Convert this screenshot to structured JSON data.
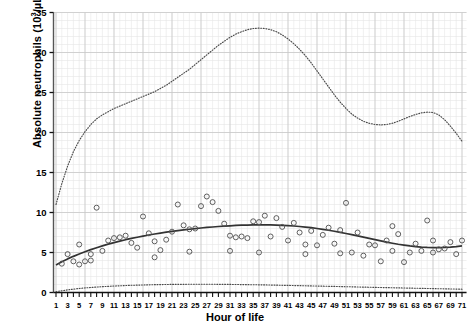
{
  "chart_data": {
    "type": "scatter",
    "title": "",
    "xlabel": "Hour of life",
    "ylabel": "Absolute neutrophils (10³/µL)",
    "ylabel_main": "Absolute neutrophils (10",
    "ylabel_sup": "3",
    "ylabel_tail": "/µL)",
    "xlim": [
      1,
      71
    ],
    "ylim": [
      0,
      35
    ],
    "yticks": [
      0,
      5,
      10,
      15,
      20,
      25,
      30,
      35
    ],
    "ytick_labels": [
      "0",
      "5",
      "10",
      "15",
      "20",
      "25",
      "30",
      "35"
    ],
    "xticks": [
      1,
      3,
      5,
      7,
      9,
      11,
      13,
      15,
      17,
      19,
      21,
      23,
      25,
      27,
      29,
      31,
      33,
      35,
      37,
      39,
      41,
      43,
      45,
      47,
      49,
      51,
      53,
      55,
      57,
      59,
      61,
      63,
      65,
      67,
      69,
      71
    ],
    "xtick_labels": [
      "1",
      "3",
      "5",
      "7",
      "9",
      "11",
      "13",
      "15",
      "17",
      "19",
      "21",
      "23",
      "25",
      "27",
      "29",
      "31",
      "33",
      "35",
      "37",
      "39",
      "41",
      "43",
      "45",
      "47",
      "49",
      "51",
      "53",
      "55",
      "57",
      "59",
      "61",
      "63",
      "65",
      "67",
      "69",
      "71"
    ],
    "x_minor_step": 1,
    "y_minor_step": 1,
    "grid": true,
    "grid_color": "#c9c9c9",
    "grid_minor_color": "#e6e6e6",
    "legend": "none",
    "series": [
      {
        "name": "Upper reference limit (97th percentile)",
        "type": "line",
        "style": "dotted",
        "color": "#4a4a4a",
        "x": [
          1,
          2,
          3,
          4,
          5,
          6,
          7,
          8,
          9,
          10,
          11,
          12,
          13,
          14,
          15,
          16,
          17,
          18,
          19,
          20,
          21,
          22,
          23,
          24,
          25,
          26,
          27,
          28,
          29,
          30,
          31,
          32,
          33,
          34,
          35,
          36,
          37,
          38,
          39,
          40,
          41,
          42,
          43,
          44,
          45,
          46,
          47,
          48,
          49,
          50,
          51,
          52,
          53,
          54,
          55,
          56,
          57,
          58,
          59,
          60,
          61,
          62,
          63,
          64,
          65,
          66,
          67,
          68,
          69,
          70,
          71
        ],
        "y": [
          11.0,
          13.6,
          15.8,
          17.6,
          19.0,
          20.1,
          21.0,
          21.7,
          22.2,
          22.6,
          23.0,
          23.3,
          23.6,
          23.9,
          24.2,
          24.5,
          24.8,
          25.1,
          25.5,
          25.9,
          26.4,
          26.9,
          27.4,
          27.9,
          28.5,
          29.1,
          29.7,
          30.3,
          30.9,
          31.4,
          31.9,
          32.3,
          32.6,
          32.85,
          33.0,
          33.05,
          33.0,
          32.85,
          32.6,
          32.2,
          31.7,
          31.1,
          30.4,
          29.6,
          28.7,
          27.7,
          26.7,
          25.7,
          24.7,
          23.8,
          23.0,
          22.3,
          21.8,
          21.4,
          21.15,
          21.0,
          20.95,
          21.0,
          21.15,
          21.4,
          21.7,
          22.0,
          22.25,
          22.45,
          22.55,
          22.5,
          22.2,
          21.6,
          20.8,
          19.9,
          18.9
        ]
      },
      {
        "name": "Mean / 50th percentile",
        "type": "line",
        "style": "solid",
        "color": "#333333",
        "x": [
          1,
          2,
          3,
          4,
          5,
          6,
          7,
          8,
          9,
          10,
          11,
          12,
          13,
          14,
          15,
          16,
          17,
          18,
          19,
          20,
          21,
          22,
          23,
          24,
          25,
          26,
          27,
          28,
          29,
          30,
          31,
          32,
          33,
          34,
          35,
          36,
          37,
          38,
          39,
          40,
          41,
          42,
          43,
          44,
          45,
          46,
          47,
          48,
          49,
          50,
          51,
          52,
          53,
          54,
          55,
          56,
          57,
          58,
          59,
          60,
          61,
          62,
          63,
          64,
          65,
          66,
          67,
          68,
          69,
          70,
          71
        ],
        "y": [
          3.45,
          3.85,
          4.2,
          4.52,
          4.82,
          5.1,
          5.36,
          5.6,
          5.83,
          6.04,
          6.24,
          6.42,
          6.6,
          6.76,
          6.91,
          7.05,
          7.19,
          7.31,
          7.43,
          7.54,
          7.64,
          7.74,
          7.83,
          7.91,
          7.99,
          8.06,
          8.13,
          8.19,
          8.25,
          8.3,
          8.34,
          8.38,
          8.41,
          8.43,
          8.45,
          8.46,
          8.46,
          8.45,
          8.43,
          8.4,
          8.36,
          8.31,
          8.25,
          8.18,
          8.1,
          8.0,
          7.9,
          7.78,
          7.66,
          7.52,
          7.38,
          7.23,
          7.08,
          6.92,
          6.76,
          6.6,
          6.45,
          6.3,
          6.16,
          6.03,
          5.92,
          5.82,
          5.74,
          5.68,
          5.64,
          5.62,
          5.62,
          5.64,
          5.68,
          5.74,
          5.82
        ]
      },
      {
        "name": "Lower reference limit (3rd percentile)",
        "type": "line",
        "style": "dotted",
        "color": "#4a4a4a",
        "x": [
          1,
          2,
          3,
          4,
          5,
          6,
          7,
          8,
          9,
          10,
          11,
          12,
          13,
          14,
          15,
          16,
          17,
          18,
          19,
          20,
          21,
          22,
          23,
          24,
          25,
          26,
          27,
          28,
          29,
          30,
          31,
          32,
          33,
          34,
          35,
          36,
          37,
          38,
          39,
          40,
          41,
          42,
          43,
          44,
          45,
          46,
          47,
          48,
          49,
          50,
          51,
          52,
          53,
          54,
          55,
          56,
          57,
          58,
          59,
          60,
          61,
          62,
          63,
          64,
          65,
          66,
          67,
          68,
          69,
          70,
          71
        ],
        "y": [
          0.1,
          0.22,
          0.33,
          0.42,
          0.5,
          0.57,
          0.63,
          0.68,
          0.73,
          0.77,
          0.81,
          0.84,
          0.87,
          0.9,
          0.92,
          0.94,
          0.96,
          0.98,
          0.99,
          1.0,
          1.01,
          1.02,
          1.02,
          1.03,
          1.03,
          1.03,
          1.03,
          1.03,
          1.02,
          1.02,
          1.01,
          1.0,
          0.99,
          0.98,
          0.97,
          0.96,
          0.95,
          0.93,
          0.92,
          0.9,
          0.89,
          0.87,
          0.86,
          0.84,
          0.82,
          0.81,
          0.79,
          0.77,
          0.76,
          0.74,
          0.72,
          0.71,
          0.69,
          0.67,
          0.66,
          0.64,
          0.62,
          0.61,
          0.59,
          0.58,
          0.56,
          0.55,
          0.53,
          0.52,
          0.5,
          0.49,
          0.47,
          0.46,
          0.44,
          0.43,
          0.41
        ]
      },
      {
        "name": "Observed absolute neutrophil counts",
        "type": "scatter",
        "marker": "open-circle",
        "color": "#555555",
        "points": [
          [
            2,
            3.6
          ],
          [
            3,
            4.8
          ],
          [
            4,
            3.9
          ],
          [
            5,
            6.0
          ],
          [
            5,
            3.5
          ],
          [
            6,
            3.9
          ],
          [
            7,
            4.0
          ],
          [
            7,
            4.8
          ],
          [
            8,
            10.6
          ],
          [
            9,
            5.2
          ],
          [
            10,
            6.5
          ],
          [
            11,
            6.8
          ],
          [
            12,
            6.9
          ],
          [
            13,
            7.1
          ],
          [
            14,
            6.2
          ],
          [
            15,
            5.6
          ],
          [
            16,
            9.5
          ],
          [
            17,
            7.4
          ],
          [
            18,
            6.4
          ],
          [
            19,
            5.3
          ],
          [
            20,
            6.6
          ],
          [
            21,
            7.6
          ],
          [
            22,
            11.0
          ],
          [
            23,
            8.4
          ],
          [
            24,
            7.9
          ],
          [
            25,
            8.0
          ],
          [
            26,
            10.8
          ],
          [
            27,
            12.0
          ],
          [
            28,
            11.3
          ],
          [
            29,
            10.2
          ],
          [
            30,
            8.6
          ],
          [
            31,
            7.1
          ],
          [
            32,
            6.9
          ],
          [
            33,
            7.0
          ],
          [
            34,
            6.8
          ],
          [
            35,
            8.9
          ],
          [
            36,
            8.8
          ],
          [
            37,
            9.6
          ],
          [
            38,
            7.0
          ],
          [
            39,
            9.3
          ],
          [
            40,
            8.2
          ],
          [
            41,
            6.5
          ],
          [
            42,
            8.7
          ],
          [
            43,
            7.5
          ],
          [
            44,
            6.0
          ],
          [
            45,
            7.7
          ],
          [
            46,
            5.9
          ],
          [
            47,
            7.2
          ],
          [
            48,
            8.1
          ],
          [
            49,
            6.1
          ],
          [
            50,
            7.8
          ],
          [
            51,
            11.2
          ],
          [
            52,
            5.0
          ],
          [
            53,
            7.5
          ],
          [
            54,
            4.6
          ],
          [
            55,
            6.0
          ],
          [
            56,
            5.9
          ],
          [
            57,
            3.9
          ],
          [
            58,
            6.5
          ],
          [
            59,
            8.3
          ],
          [
            60,
            7.3
          ],
          [
            61,
            3.8
          ],
          [
            62,
            5.0
          ],
          [
            63,
            6.1
          ],
          [
            64,
            5.2
          ],
          [
            65,
            9.0
          ],
          [
            66,
            6.5
          ],
          [
            67,
            5.4
          ],
          [
            68,
            5.5
          ],
          [
            69,
            6.3
          ],
          [
            70,
            4.8
          ],
          [
            71,
            6.5
          ],
          [
            66,
            5.0
          ],
          [
            59,
            5.2
          ],
          [
            44,
            4.8
          ],
          [
            50,
            4.9
          ],
          [
            36,
            5.0
          ],
          [
            31,
            5.2
          ],
          [
            24,
            5.1
          ],
          [
            18,
            4.4
          ]
        ]
      }
    ]
  }
}
